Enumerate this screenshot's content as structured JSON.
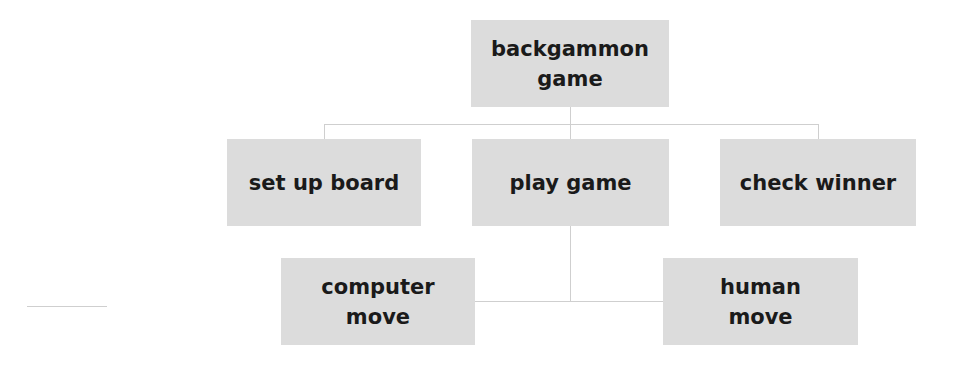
{
  "diagram": {
    "type": "hierarchy-chart",
    "root": {
      "label": "backgammon\ngame"
    },
    "level1": [
      {
        "label": "set up board"
      },
      {
        "label": "play game"
      },
      {
        "label": "check winner"
      }
    ],
    "level2": [
      {
        "label": "computer\nmove",
        "parent": "play game"
      },
      {
        "label": "human\nmove",
        "parent": "play game"
      }
    ],
    "colors": {
      "box": "#dcdcdc",
      "text": "#1a1a1a",
      "line": "#cfcfcf"
    }
  }
}
